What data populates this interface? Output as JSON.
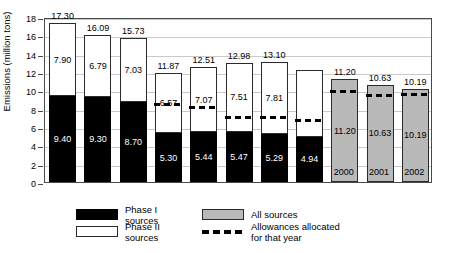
{
  "chart_data": {
    "type": "bar",
    "title": "",
    "subtitle": "",
    "xlabel": "",
    "ylabel": "Emissions (million tons)",
    "ylim": [
      0,
      18
    ],
    "ytick_step": 2,
    "yticks": [
      "0",
      "2",
      "4",
      "6",
      "8",
      "10",
      "12",
      "14",
      "16",
      "18"
    ],
    "grid": true,
    "stacked": true,
    "legend_position": "bottom",
    "categories": [
      "1980",
      "1985",
      "1990",
      "1995",
      "1996",
      "1997",
      "1998",
      "1999",
      "2000",
      "2001",
      "2002"
    ],
    "series": [
      {
        "name": "Phase I sources",
        "color": "#000000",
        "values": [
          9.4,
          9.3,
          8.7,
          5.3,
          5.44,
          5.47,
          5.29,
          4.94,
          null,
          null,
          null
        ],
        "labels": [
          "9.40",
          "9.30",
          "8.70",
          "5.30",
          "5.44",
          "5.47",
          "5.29",
          "4.94",
          "",
          "",
          ""
        ]
      },
      {
        "name": "Phase II sources",
        "color": "#ffffff",
        "values": [
          7.9,
          6.79,
          7.03,
          6.57,
          7.07,
          7.51,
          7.81,
          7.31,
          null,
          null,
          null
        ],
        "labels": [
          "7.90",
          "6.79",
          "7.03",
          "6.57",
          "7.07",
          "7.51",
          "7.81",
          "",
          "",
          "",
          ""
        ]
      },
      {
        "name": "All sources",
        "color": "#b9b9b9",
        "values": [
          null,
          null,
          null,
          null,
          null,
          null,
          null,
          null,
          11.2,
          10.63,
          10.19
        ],
        "labels": [
          "",
          "",
          "",
          "",
          "",
          "",
          "",
          "",
          "11.20",
          "10.63",
          "10.19"
        ]
      },
      {
        "name": "Allowances allocated for that year",
        "color": "#000000",
        "style": "dashed-line",
        "values": [
          null,
          null,
          null,
          8.5,
          8.1,
          7.05,
          7.05,
          6.7,
          9.9,
          9.45,
          9.55
        ]
      }
    ],
    "totals": [
      17.3,
      16.09,
      15.73,
      11.87,
      12.51,
      12.98,
      13.1,
      12.25,
      11.2,
      10.63,
      10.19
    ],
    "total_labels": [
      "17.30",
      "16.09",
      "15.73",
      "11.87",
      "12.51",
      "12.98",
      "13.10",
      "",
      "11.20",
      "10.63",
      "10.19"
    ]
  },
  "legend": {
    "items": [
      {
        "label": "Phase I sources",
        "swatch": "phase-one-swatch"
      },
      {
        "label": "All sources",
        "swatch": "all-sources-swatch"
      },
      {
        "label": "Phase II sources",
        "swatch": "phase-two-swatch"
      },
      {
        "label": "Allowances allocated for that year",
        "swatch": "dashed-line-swatch"
      }
    ]
  }
}
